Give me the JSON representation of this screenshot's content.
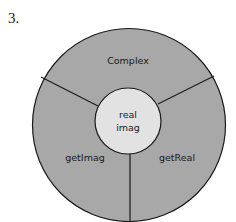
{
  "figure": {
    "number": "3.",
    "outer_ring": {
      "segments": [
        {
          "name": "top",
          "label": "Complex"
        },
        {
          "name": "left",
          "label": "getImag"
        },
        {
          "name": "right",
          "label": "getReal"
        }
      ],
      "color": "#a8a8a8"
    },
    "inner_circle": {
      "lines": [
        "real",
        "imag"
      ],
      "color": "#e2e2e2"
    },
    "stroke_color": "#1a1a1a"
  }
}
